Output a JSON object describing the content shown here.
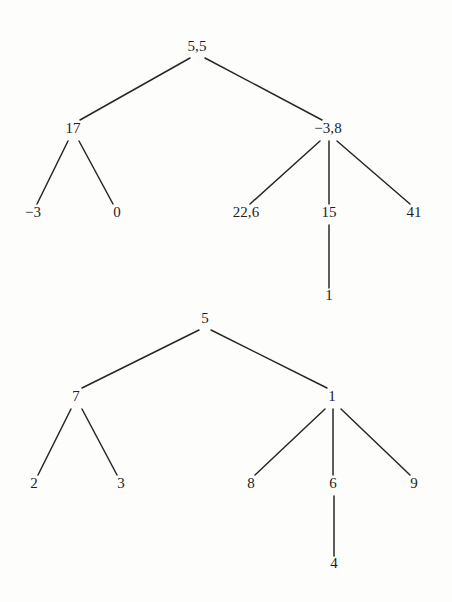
{
  "figure": {
    "background_color": "#fdfdfc",
    "ink_color": "#272727",
    "text_color": "#1d1d1d"
  },
  "trees": [
    {
      "name": "upper-tree",
      "root": "5,5",
      "nodes": [
        {
          "id": "t1-n0",
          "label": "5,5",
          "x": 197,
          "y": 51,
          "level": 0,
          "parent": null
        },
        {
          "id": "t1-n1",
          "label": "17",
          "x": 73,
          "y": 133,
          "level": 1,
          "parent": "t1-n0"
        },
        {
          "id": "t1-n2",
          "label": "−3,8",
          "x": 328,
          "y": 133,
          "level": 1,
          "parent": "t1-n0"
        },
        {
          "id": "t1-n3",
          "label": "−3",
          "x": 33,
          "y": 217,
          "level": 2,
          "parent": "t1-n1"
        },
        {
          "id": "t1-n4",
          "label": "0",
          "x": 117,
          "y": 217,
          "level": 2,
          "parent": "t1-n1"
        },
        {
          "id": "t1-n5",
          "label": "22,6",
          "x": 246,
          "y": 217,
          "level": 2,
          "parent": "t1-n2"
        },
        {
          "id": "t1-n6",
          "label": "15",
          "x": 329,
          "y": 217,
          "level": 2,
          "parent": "t1-n2"
        },
        {
          "id": "t1-n7",
          "label": "41",
          "x": 414,
          "y": 217,
          "level": 2,
          "parent": "t1-n2"
        },
        {
          "id": "t1-n8",
          "label": "1",
          "x": 329,
          "y": 300,
          "level": 3,
          "parent": "t1-n6"
        }
      ],
      "edges": [
        {
          "from": "t1-n0",
          "to": "t1-n1",
          "x1": 190,
          "y1": 58,
          "x2": 80,
          "y2": 120
        },
        {
          "from": "t1-n0",
          "to": "t1-n2",
          "x1": 205,
          "y1": 58,
          "x2": 322,
          "y2": 120
        },
        {
          "from": "t1-n1",
          "to": "t1-n3",
          "x1": 68,
          "y1": 141,
          "x2": 37,
          "y2": 204
        },
        {
          "from": "t1-n1",
          "to": "t1-n4",
          "x1": 79,
          "y1": 141,
          "x2": 113,
          "y2": 204
        },
        {
          "from": "t1-n2",
          "to": "t1-n5",
          "x1": 320,
          "y1": 141,
          "x2": 250,
          "y2": 204
        },
        {
          "from": "t1-n2",
          "to": "t1-n6",
          "x1": 329,
          "y1": 141,
          "x2": 329,
          "y2": 204
        },
        {
          "from": "t1-n2",
          "to": "t1-n7",
          "x1": 337,
          "y1": 141,
          "x2": 410,
          "y2": 204
        },
        {
          "from": "t1-n6",
          "to": "t1-n8",
          "x1": 329,
          "y1": 225,
          "x2": 329,
          "y2": 288
        }
      ]
    },
    {
      "name": "lower-tree",
      "root": "5",
      "nodes": [
        {
          "id": "t2-n0",
          "label": "5",
          "x": 205,
          "y": 323,
          "level": 0,
          "parent": null
        },
        {
          "id": "t2-n1",
          "label": "7",
          "x": 76,
          "y": 401,
          "level": 1,
          "parent": "t2-n0"
        },
        {
          "id": "t2-n2",
          "label": "1",
          "x": 332,
          "y": 401,
          "level": 1,
          "parent": "t2-n0"
        },
        {
          "id": "t2-n3",
          "label": "2",
          "x": 34,
          "y": 488,
          "level": 2,
          "parent": "t2-n1"
        },
        {
          "id": "t2-n4",
          "label": "3",
          "x": 121,
          "y": 488,
          "level": 2,
          "parent": "t2-n1"
        },
        {
          "id": "t2-n5",
          "label": "8",
          "x": 251,
          "y": 488,
          "level": 2,
          "parent": "t2-n2"
        },
        {
          "id": "t2-n6",
          "label": "6",
          "x": 333,
          "y": 488,
          "level": 2,
          "parent": "t2-n2"
        },
        {
          "id": "t2-n7",
          "label": "9",
          "x": 414,
          "y": 488,
          "level": 2,
          "parent": "t2-n2"
        },
        {
          "id": "t2-n8",
          "label": "4",
          "x": 334,
          "y": 568,
          "level": 3,
          "parent": "t2-n6"
        }
      ],
      "edges": [
        {
          "from": "t2-n0",
          "to": "t2-n1",
          "x1": 199,
          "y1": 330,
          "x2": 82,
          "y2": 388
        },
        {
          "from": "t2-n0",
          "to": "t2-n2",
          "x1": 211,
          "y1": 330,
          "x2": 327,
          "y2": 388
        },
        {
          "from": "t2-n1",
          "to": "t2-n3",
          "x1": 71,
          "y1": 409,
          "x2": 38,
          "y2": 475
        },
        {
          "from": "t2-n1",
          "to": "t2-n4",
          "x1": 82,
          "y1": 409,
          "x2": 117,
          "y2": 475
        },
        {
          "from": "t2-n2",
          "to": "t2-n5",
          "x1": 325,
          "y1": 409,
          "x2": 255,
          "y2": 475
        },
        {
          "from": "t2-n2",
          "to": "t2-n6",
          "x1": 333,
          "y1": 409,
          "x2": 333,
          "y2": 475
        },
        {
          "from": "t2-n2",
          "to": "t2-n7",
          "x1": 341,
          "y1": 409,
          "x2": 410,
          "y2": 475
        },
        {
          "from": "t2-n6",
          "to": "t2-n8",
          "x1": 334,
          "y1": 496,
          "x2": 334,
          "y2": 556
        }
      ]
    }
  ]
}
